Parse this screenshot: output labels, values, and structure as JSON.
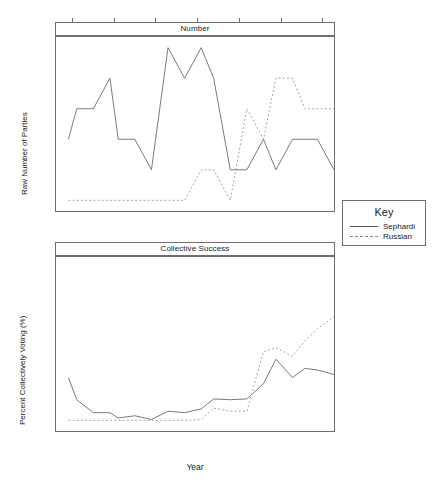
{
  "figure": {
    "xlabel": "Year",
    "xticks": [
      1950,
      1960,
      1970,
      1980,
      1990,
      2000,
      2010
    ],
    "xlim": [
      1946,
      2013
    ]
  },
  "legend": {
    "title": "Key",
    "entries": [
      {
        "label": "Sephardi",
        "style": "solid"
      },
      {
        "label": "Russian",
        "style": "dashed"
      }
    ]
  },
  "chart_data": [
    {
      "type": "line",
      "title": "Number",
      "panel": "top",
      "xlabel": "Year",
      "ylabel": "Raw Number of Parties",
      "xlim": [
        1946,
        2013
      ],
      "ylim": [
        -0.35,
        5.35
      ],
      "yticks": [
        0,
        1,
        2,
        3,
        4,
        5
      ],
      "xticks": [
        1950,
        1960,
        1970,
        1980,
        1990,
        2000,
        2010
      ],
      "grid": false,
      "legend_position": "right",
      "series": [
        {
          "name": "Sephardi",
          "style": "solid",
          "x": [
            1949,
            1951,
            1955,
            1959,
            1961,
            1965,
            1969,
            1973,
            1977,
            1981,
            1984,
            1988,
            1992,
            1996,
            1999,
            2003,
            2006,
            2009,
            2013
          ],
          "y": [
            2,
            3,
            3,
            4,
            2,
            2,
            1,
            5,
            4,
            5,
            4,
            1,
            1,
            2,
            1,
            2,
            2,
            2,
            1
          ]
        },
        {
          "name": "Russian",
          "style": "dashed",
          "x": [
            1949,
            1951,
            1955,
            1959,
            1961,
            1965,
            1969,
            1973,
            1977,
            1981,
            1984,
            1988,
            1992,
            1996,
            1999,
            2003,
            2006,
            2009,
            2013
          ],
          "y": [
            0,
            0,
            0,
            0,
            0,
            0,
            0,
            0,
            0,
            1,
            1,
            0,
            3,
            2,
            4,
            4,
            3,
            3,
            3
          ]
        }
      ]
    },
    {
      "type": "line",
      "title": "Collective Success",
      "panel": "bottom",
      "xlabel": "Year",
      "ylabel": "Percent Collectively Voting (%)",
      "xlim": [
        1946,
        2013
      ],
      "ylim": [
        -7,
        107
      ],
      "yticks": [
        0,
        20,
        40,
        60,
        80,
        100
      ],
      "xticks": [
        1950,
        1960,
        1970,
        1980,
        1990,
        2000,
        2010
      ],
      "grid": false,
      "legend_position": "right",
      "series": [
        {
          "name": "Sephardi",
          "style": "solid",
          "x": [
            1949,
            1951,
            1955,
            1959,
            1961,
            1965,
            1969,
            1973,
            1977,
            1981,
            1984,
            1988,
            1992,
            1996,
            1999,
            2003,
            2006,
            2009,
            2013
          ],
          "y": [
            28,
            13.5,
            5,
            5,
            1.5,
            3,
            0.5,
            6,
            5,
            7.5,
            14,
            13.5,
            14,
            24,
            40,
            28,
            34,
            33,
            30
          ]
        },
        {
          "name": "Russian",
          "style": "dashed",
          "x": [
            1949,
            1951,
            1955,
            1959,
            1961,
            1965,
            1969,
            1973,
            1977,
            1981,
            1984,
            1988,
            1992,
            1996,
            1999,
            2003,
            2006,
            2009,
            2013
          ],
          "y": [
            0,
            0,
            0,
            0,
            0,
            0,
            0,
            0,
            0,
            0.5,
            8,
            6,
            6,
            45,
            47.5,
            42,
            52,
            60,
            68
          ]
        }
      ]
    }
  ]
}
